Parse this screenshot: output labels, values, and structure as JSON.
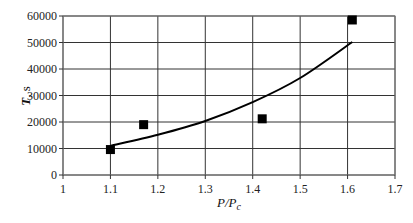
{
  "chart_data": {
    "type": "scatter",
    "title": "",
    "xlabel": "P/P_c",
    "ylabel": "T, s",
    "xlim": [
      1,
      1.7
    ],
    "ylim": [
      0,
      60000
    ],
    "grid": true,
    "legend": null,
    "x_ticks": [
      "1",
      "1.1",
      "1.2",
      "1.3",
      "1.4",
      "1.5",
      "1.6",
      "1.7"
    ],
    "y_ticks": [
      "0",
      "10000",
      "20000",
      "30000",
      "40000",
      "50000",
      "60000"
    ],
    "series": [
      {
        "name": "measured",
        "kind": "scatter",
        "marker": "square",
        "color": "#000000",
        "x": [
          1.1,
          1.17,
          1.42,
          1.61
        ],
        "y": [
          9600,
          19000,
          21200,
          58500
        ]
      },
      {
        "name": "fit",
        "kind": "line",
        "color": "#000000",
        "x": [
          1.1,
          1.2,
          1.3,
          1.4,
          1.5,
          1.61
        ],
        "y": [
          11000,
          15200,
          20400,
          27500,
          36600,
          50200
        ]
      }
    ]
  },
  "labels": {
    "ylabel_main": "T",
    "ylabel_unit": ", s",
    "xlabel_main": "P/P",
    "xlabel_sub": "c"
  }
}
